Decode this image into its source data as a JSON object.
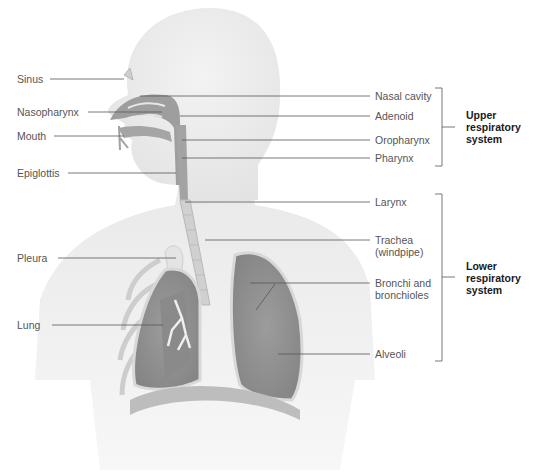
{
  "diagram": {
    "left_labels": [
      {
        "id": "sinus",
        "text": "Sinus"
      },
      {
        "id": "nasopharynx",
        "text": "Nasopharynx"
      },
      {
        "id": "mouth",
        "text": "Mouth"
      },
      {
        "id": "epiglottis",
        "text": "Epiglottis"
      },
      {
        "id": "pleura",
        "text": "Pleura"
      },
      {
        "id": "lung",
        "text": "Lung"
      }
    ],
    "right_labels": [
      {
        "id": "nasal-cavity",
        "text": "Nasal cavity"
      },
      {
        "id": "adenoid",
        "text": "Adenoid"
      },
      {
        "id": "oropharynx",
        "text": "Oropharynx"
      },
      {
        "id": "pharynx",
        "text": "Pharynx"
      },
      {
        "id": "larynx",
        "text": "Larynx"
      },
      {
        "id": "trachea",
        "line1": "Trachea",
        "line2": "(windpipe)"
      },
      {
        "id": "bronchi",
        "line1": "Bronchi and",
        "line2": "bronchioles"
      },
      {
        "id": "alveoli",
        "text": "Alveoli"
      }
    ],
    "groups": {
      "upper": {
        "line1": "Upper",
        "line2": "respiratory",
        "line3": "system"
      },
      "lower": {
        "line1": "Lower",
        "line2": "respiratory",
        "line3": "system"
      }
    },
    "caption": "",
    "colors": {
      "body": "#ebebeb",
      "organ": "#9a9a9a",
      "organ_dark": "#7d7d7d",
      "leader_line": "#555555",
      "label_text": "#555555",
      "group_text": "#1a1a1a"
    }
  }
}
